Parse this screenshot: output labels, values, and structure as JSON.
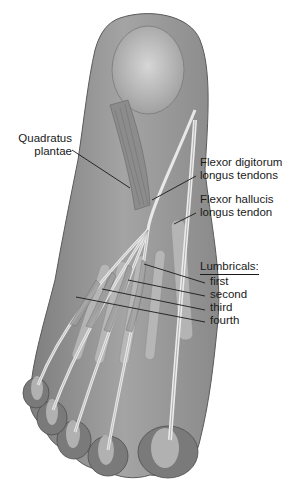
{
  "figure": {
    "colors": {
      "background": "#ffffff",
      "skin_outline": "#8a8a8a",
      "muscle": "#9a9a9a",
      "bone": "#c8c8c8",
      "tendon": "#e6e6e6",
      "leader_line": "#1a1a1a"
    }
  },
  "labels": {
    "quadratus_line1": "Quadratus",
    "quadratus_line2": "plantae",
    "fdl_line1": "Flexor digitorum",
    "fdl_line2": "longus tendons",
    "fhl_line1": "Flexor hallucis",
    "fhl_line2": "longus tendon",
    "lumbricals_heading": "Lumbricals:",
    "lumbricals": [
      "first",
      "second",
      "third",
      "fourth"
    ]
  }
}
